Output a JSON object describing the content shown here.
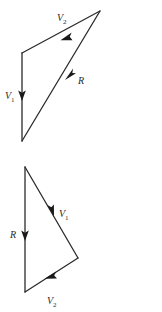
{
  "figure": {
    "type": "vector-addition-diagram",
    "background_color": "#ffffff",
    "line_color": "#2b2b2b",
    "arrow_color": "#1a1a1a",
    "panels": [
      {
        "name": "top-panel",
        "vectors": [
          {
            "id": "top-v1",
            "label_base": "V",
            "label_sub": "1",
            "label_full": "V1",
            "label_x": 7,
            "label_y": 98,
            "x1": 22,
            "y1": 53,
            "x2": 22,
            "y2": 141,
            "arrow_x": 22,
            "arrow_y": 98,
            "arrow_angle": 90
          },
          {
            "id": "top-v2",
            "label_base": "V",
            "label_sub": "2",
            "label_full": "V2",
            "label_x": 58,
            "label_y": 22,
            "x1": 100,
            "y1": 11,
            "x2": 22,
            "y2": 53,
            "arrow_x": 64,
            "arrow_y": 38,
            "arrow_angle": 208.3
          },
          {
            "id": "top-r",
            "label_base": "R",
            "label_sub": "",
            "label_full": "R",
            "label_x": 79,
            "label_y": 84,
            "x1": 22,
            "y1": 141,
            "x2": 100,
            "y2": 11,
            "arrow_x": 69,
            "arrow_y": 63,
            "arrow_angle": 301.0
          }
        ]
      },
      {
        "name": "bottom-panel",
        "vectors": [
          {
            "id": "bottom-v1",
            "label_base": "V",
            "label_sub": "1",
            "label_full": "V1",
            "label_x": 60,
            "label_y": 218,
            "x1": 25,
            "y1": 167,
            "x2": 78,
            "y2": 258,
            "arrow_x": 51,
            "arrow_y": 212,
            "arrow_angle": 59.8
          },
          {
            "id": "bottom-v2",
            "label_base": "V",
            "label_sub": "2",
            "label_full": "V2",
            "label_x": 48,
            "label_y": 304,
            "x1": 78,
            "y1": 258,
            "x2": 25,
            "y2": 292,
            "arrow_x": 51,
            "arrow_y": 275,
            "arrow_angle": 212.7
          },
          {
            "id": "bottom-r",
            "label_base": "R",
            "label_sub": "",
            "label_full": "R",
            "label_x": 11,
            "label_y": 238,
            "x1": 25,
            "y1": 167,
            "x2": 25,
            "y2": 292,
            "arrow_x": 25,
            "arrow_y": 237,
            "arrow_angle": 90
          }
        ]
      }
    ]
  }
}
